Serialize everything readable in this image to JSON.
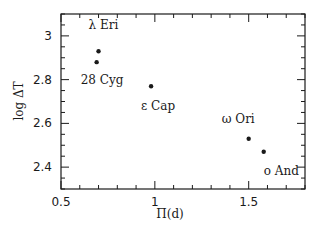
{
  "chart_data": {
    "type": "scatter",
    "title": "",
    "xlabel": "Π(d)",
    "ylabel": "log ΔT",
    "xlim": [
      0.5,
      1.8
    ],
    "ylim": [
      2.3,
      3.1
    ],
    "x_ticks": [
      0.5,
      1,
      1.5
    ],
    "x_tick_labels": [
      "0.5",
      "1",
      "1.5"
    ],
    "x_minor_step": 0.1,
    "y_ticks": [
      2.4,
      2.6,
      2.8,
      3
    ],
    "y_tick_labels": [
      "2.4",
      "2.6",
      "2.8",
      "3"
    ],
    "y_minor_step": 0.05,
    "grid": false,
    "legend": null,
    "points": [
      {
        "label": "λ Eri",
        "x": 0.7,
        "y": 2.93,
        "label_dx": -10,
        "label_dy": -22
      },
      {
        "label": "28 Cyg",
        "x": 0.69,
        "y": 2.88,
        "label_dx": -16,
        "label_dy": 22
      },
      {
        "label": "ε Cap",
        "x": 0.98,
        "y": 2.77,
        "label_dx": -10,
        "label_dy": 24
      },
      {
        "label": "ω Ori",
        "x": 1.5,
        "y": 2.53,
        "label_dx": -27,
        "label_dy": -16
      },
      {
        "label": "And",
        "x": 1.58,
        "y": 2.47,
        "label_dx": 0,
        "label_dy": 23,
        "marker_prefix": "o"
      }
    ]
  },
  "colors": {
    "ink": "#1a1a1a",
    "background": "#ffffff"
  }
}
